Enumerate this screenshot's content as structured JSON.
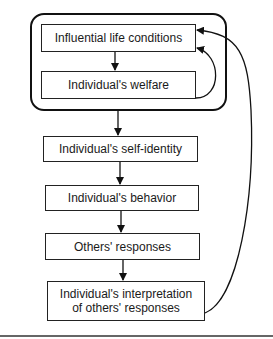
{
  "diagram": {
    "group": {
      "label": "",
      "boxes": [
        {
          "id": "life-conditions",
          "text": "Influential life conditions"
        },
        {
          "id": "welfare",
          "text": "Individual's welfare"
        }
      ]
    },
    "chain": [
      {
        "id": "self-identity",
        "text": "Individual's self-identity"
      },
      {
        "id": "behavior",
        "text": "Individual's behavior"
      },
      {
        "id": "others-responses",
        "text": "Others' responses"
      },
      {
        "id": "interpretation",
        "text": "Individual's interpretation of others' responses",
        "line1": "Individual's interpretation",
        "line2": "of others' responses"
      }
    ],
    "edges": [
      {
        "from": "life-conditions",
        "to": "welfare"
      },
      {
        "from": "group",
        "to": "self-identity"
      },
      {
        "from": "self-identity",
        "to": "behavior"
      },
      {
        "from": "behavior",
        "to": "others-responses"
      },
      {
        "from": "others-responses",
        "to": "interpretation"
      },
      {
        "from": "welfare",
        "to": "life-conditions",
        "style": "curved-feedback"
      },
      {
        "from": "interpretation",
        "to": "life-conditions",
        "style": "curved-feedback"
      }
    ],
    "colors": {
      "stroke": "#111111",
      "background": "#ffffff"
    }
  }
}
